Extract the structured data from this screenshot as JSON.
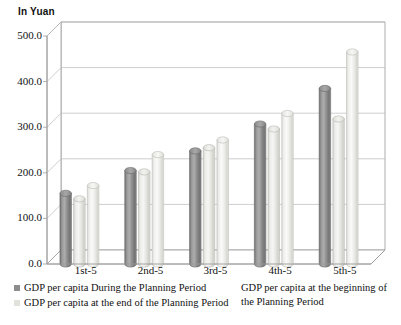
{
  "chart_data": {
    "type": "bar",
    "title": "",
    "subtitle": "",
    "unit_label": "In Yuan",
    "xlabel": "",
    "ylabel": "",
    "ylim": [
      0,
      500
    ],
    "ytick_values": [
      0,
      100,
      200,
      300,
      400,
      500
    ],
    "ytick_labels": [
      "0.0",
      "100.0",
      "200.0",
      "300.0",
      "400.0",
      "500.0"
    ],
    "grid": true,
    "three_d": true,
    "legend_position": "bottom",
    "categories": [
      "1st-5",
      "2nd-5",
      "3rd-5",
      "4th-5",
      "5th-5"
    ],
    "series": [
      {
        "name": "GDP per capita During the Planning Period",
        "color": "#8d8d8d",
        "values": [
          155,
          205,
          248,
          307,
          385
        ]
      },
      {
        "name": "GDP per capita at the end of the Planning Period",
        "color": "#e6e6e1",
        "values": [
          143,
          202,
          255,
          296,
          318
        ]
      },
      {
        "name": "GDP per capita at the beginning of the Planning Period",
        "color": "#ececes",
        "values": [
          172,
          240,
          272,
          330,
          465
        ]
      }
    ]
  },
  "legend": {
    "left_entries": [
      {
        "label": "GDP per capita During the Planning Period",
        "swatch": "#8d8d8d"
      },
      {
        "label": "GDP per capita at the end of the Planning Period",
        "swatch": "#e2e2dd"
      }
    ],
    "right_entries": [
      {
        "label": "GDP per capita at the beginning of the Planning Period",
        "swatch": ""
      }
    ]
  },
  "colors": {
    "series1": "#8d8d8d",
    "series2": "#e6e6e1",
    "series3": "#ededea",
    "gridline": "#b9b9b9",
    "axis": "#9a9a9a",
    "text": "#111111",
    "background": "#ffffff"
  }
}
